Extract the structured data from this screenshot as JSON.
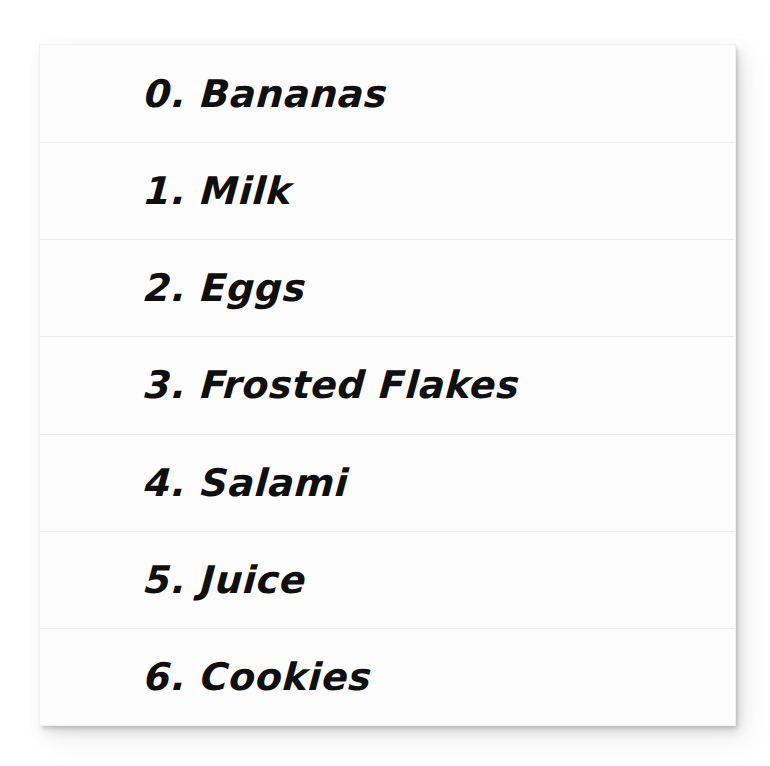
{
  "document": {
    "kind": "shopping-list",
    "top_clipped_text": "",
    "card": {
      "background_color": "#fdfdfd",
      "separator_color": "#ececec",
      "text_color": "#100f0f"
    }
  },
  "list": {
    "items": [
      {
        "index": "0.",
        "label": "Bananas",
        "text": "0. Bananas"
      },
      {
        "index": "1.",
        "label": "Milk",
        "text": "1. Milk"
      },
      {
        "index": "2.",
        "label": "Eggs",
        "text": "2. Eggs"
      },
      {
        "index": "3.",
        "label": "Frosted Flakes",
        "text": "3. Frosted Flakes"
      },
      {
        "index": "4.",
        "label": "Salami",
        "text": "4. Salami"
      },
      {
        "index": "5.",
        "label": "Juice",
        "text": "5. Juice"
      },
      {
        "index": "6.",
        "label": "Cookies",
        "text": "6. Cookies"
      }
    ]
  }
}
